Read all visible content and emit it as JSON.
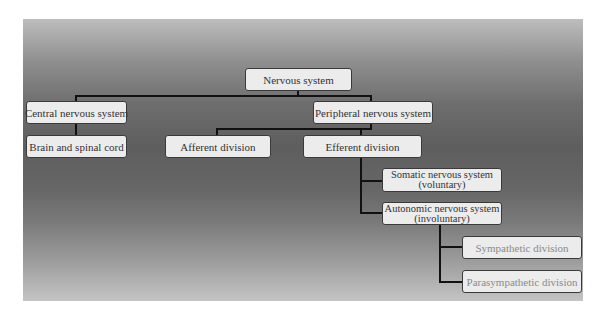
{
  "diagram": {
    "type": "hierarchy",
    "title": "Nervous system",
    "nodes": {
      "root": {
        "label": "Nervous system"
      },
      "cns": {
        "label": "Central nervous system"
      },
      "pns": {
        "label": "Peripheral nervous system"
      },
      "brain": {
        "label": "Brain and spinal cord"
      },
      "afferent": {
        "label": "Afferent division"
      },
      "efferent": {
        "label": "Efferent division"
      },
      "somatic": {
        "line1": "Somatic nervous system",
        "line2": "(voluntary)"
      },
      "autonomic": {
        "line1": "Autonomic nervous system",
        "line2": "(involuntary)"
      },
      "sympathetic": {
        "label": "Sympathetic division"
      },
      "parasympathetic": {
        "label": "Parasympathetic division"
      }
    },
    "edges": [
      [
        "Nervous system",
        "Central nervous system"
      ],
      [
        "Nervous system",
        "Peripheral nervous system"
      ],
      [
        "Central nervous system",
        "Brain and spinal cord"
      ],
      [
        "Peripheral nervous system",
        "Afferent division"
      ],
      [
        "Peripheral nervous system",
        "Efferent division"
      ],
      [
        "Efferent division",
        "Somatic nervous system (voluntary)"
      ],
      [
        "Efferent division",
        "Autonomic nervous system (involuntary)"
      ],
      [
        "Autonomic nervous system (involuntary)",
        "Sympathetic division"
      ],
      [
        "Autonomic nervous system (involuntary)",
        "Parasympathetic division"
      ]
    ],
    "colors": {
      "box_fill": "#ececec",
      "box_text": "#333333",
      "faded_text": "#8a8a8a",
      "connector": "#111111"
    }
  }
}
